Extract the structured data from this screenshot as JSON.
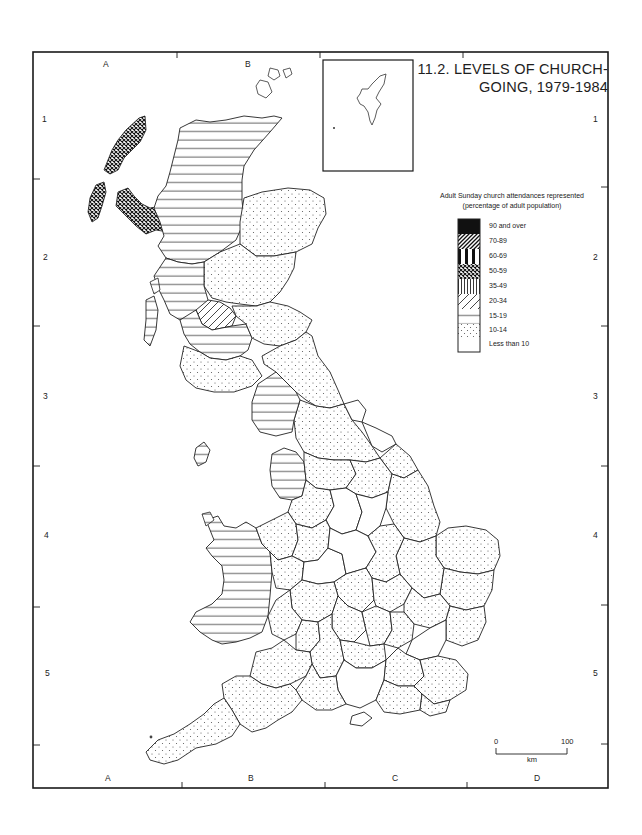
{
  "title": {
    "line1": "11.2. LEVELS OF CHURCH-",
    "line2": "GOING, 1979-1984"
  },
  "legend": {
    "heading_line1": "Adult Sunday church attendances represented",
    "heading_line2": "(percentage of adult population)",
    "items": [
      {
        "label": "90 and over",
        "pattern": "solid-black"
      },
      {
        "label": "70-89",
        "pattern": "dense-diagonal"
      },
      {
        "label": "60-69",
        "pattern": "thick-vertical"
      },
      {
        "label": "50-59",
        "pattern": "crosshatch"
      },
      {
        "label": "35-49",
        "pattern": "vertical-lines"
      },
      {
        "label": "20-34",
        "pattern": "sparse-diagonal"
      },
      {
        "label": "15-19",
        "pattern": "horizontal-lines"
      },
      {
        "label": "10-14",
        "pattern": "dots"
      },
      {
        "label": "Less than 10",
        "pattern": "blank"
      }
    ]
  },
  "grid": {
    "columns": [
      "A",
      "B",
      "C",
      "D"
    ],
    "rows": [
      "1",
      "2",
      "3",
      "4",
      "5"
    ]
  },
  "scale_bar": {
    "start": "0",
    "end": "100",
    "unit": "km"
  },
  "colors": {
    "ink": "#1a1a1a",
    "paper": "#ffffff"
  },
  "regions_summary": {
    "western_isles_skye": "50-59",
    "highland": "15-19",
    "grampian": "10-14",
    "tayside_central_fife": "10-14",
    "strathclyde_north": "15-19",
    "strathclyde_glasgow": "20-34",
    "strathclyde_south": "15-19",
    "lothian_borders": "10-14",
    "dumfries_galloway": "10-14",
    "northumberland_durham_yorkshire": "10-14",
    "cumbria": "15-19",
    "lancashire_merseyside": "15-19",
    "isle_of_man": "15-19",
    "wales": "15-19",
    "east_anglia_south_east": "10-14",
    "south_west": "10-14",
    "some_midland_and_southern_counties": "Less than 10"
  }
}
